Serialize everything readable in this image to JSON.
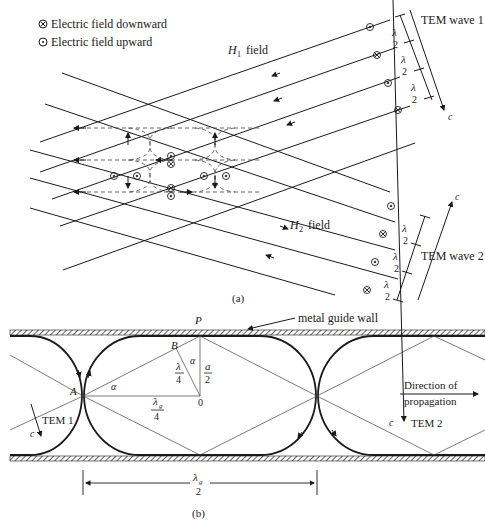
{
  "legend": {
    "downward": {
      "icon": "circle-cross-icon",
      "label": "Electric field downward"
    },
    "upward": {
      "icon": "circle-dot-icon",
      "label": "Electric field upward"
    }
  },
  "panel_a": {
    "caption": "(a)",
    "h1_label": "H",
    "h1_sub": "1",
    "h1_suffix": "field",
    "h2_label": "H",
    "h2_sub": "2",
    "h2_suffix": "field",
    "wave1_label": "TEM wave 1",
    "wave2_label": "TEM wave 2",
    "c_label": "c",
    "lambda_num": "λ",
    "lambda_den": "2"
  },
  "panel_b": {
    "caption": "(b)",
    "p_label": "P",
    "wall_label": "metal guide wall",
    "a_label": "A",
    "b_label": "B",
    "o_label": "0",
    "alpha": "α",
    "lambda4_num": "λ",
    "lambda4_den": "4",
    "a2_num": "a",
    "a2_den": "2",
    "lg4_num": "λ",
    "lg4_sub": "g",
    "lg4_den": "4",
    "lg2_num": "λ",
    "lg2_sub": "g",
    "lg2_den": "2",
    "tem1": "TEM 1",
    "tem2": "TEM 2",
    "c_label": "c",
    "direction_line1": "Direction of",
    "direction_line2": "propagation"
  },
  "colors": {
    "ink": "#1a1a1a",
    "dashed": "#555555",
    "background": "#ffffff"
  }
}
